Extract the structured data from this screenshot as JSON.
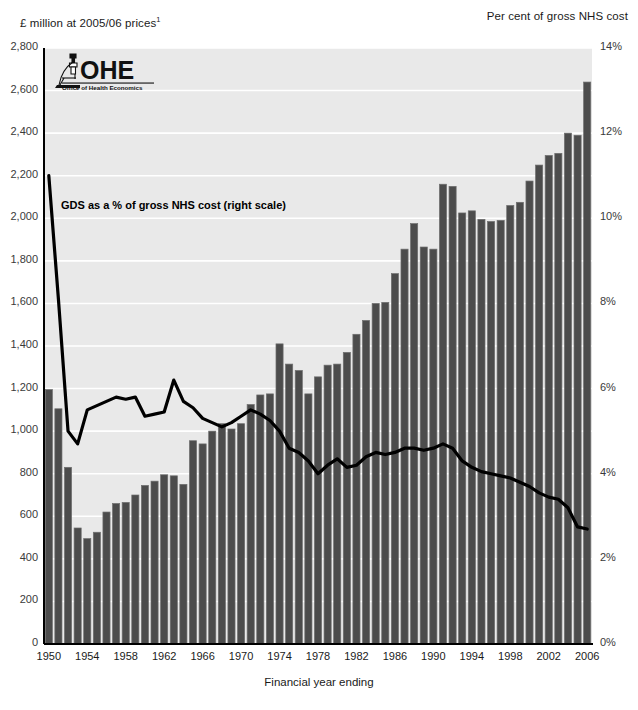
{
  "header": {
    "left_axis_title": "£ million at 2005/06 prices",
    "left_axis_title_sup": "1",
    "right_axis_title": "Per cent of gross NHS cost"
  },
  "logo": {
    "name": "OHE",
    "wordmark": "OHE",
    "subtitle": "Office of Health Economics"
  },
  "annotation": "GDS as a % of gross NHS cost (right scale)",
  "colors": {
    "plot_background": "#e9e9e9",
    "gridline": "#ffffff",
    "bar_fill": "#4c4c4c",
    "bar_edge": "#6e6e6e",
    "line": "#000000",
    "axis": "#000000",
    "tick_text": "#3a3a3a"
  },
  "chart_data": {
    "type": "bar",
    "title": "",
    "xlabel": "Financial year ending",
    "ylabel": "£ million at 2005/06 prices",
    "y2label": "Per cent of gross NHS cost",
    "grid": true,
    "legend": "none",
    "ylim": [
      0,
      2800
    ],
    "y2lim": [
      0,
      14
    ],
    "yticks": [
      0,
      200,
      400,
      600,
      800,
      1000,
      1200,
      1400,
      1600,
      1800,
      2000,
      2200,
      2400,
      2600,
      2800
    ],
    "ytick_labels": [
      "0",
      "200",
      "400",
      "600",
      "800",
      "1,000",
      "1,200",
      "1,400",
      "1,600",
      "1,800",
      "2,000",
      "2,200",
      "2,400",
      "2,600",
      "2,800"
    ],
    "y2ticks": [
      0,
      2,
      4,
      6,
      8,
      10,
      12,
      14
    ],
    "y2tick_labels": [
      "0%",
      "2%",
      "4%",
      "6%",
      "8%",
      "10%",
      "12%",
      "14%"
    ],
    "categories": [
      1950,
      1951,
      1952,
      1953,
      1954,
      1955,
      1956,
      1957,
      1958,
      1959,
      1960,
      1961,
      1962,
      1963,
      1964,
      1965,
      1966,
      1967,
      1968,
      1969,
      1970,
      1971,
      1972,
      1973,
      1974,
      1975,
      1976,
      1977,
      1978,
      1979,
      1980,
      1981,
      1982,
      1983,
      1984,
      1985,
      1986,
      1987,
      1988,
      1989,
      1990,
      1991,
      1992,
      1993,
      1994,
      1995,
      1996,
      1997,
      1998,
      1999,
      2000,
      2001,
      2002,
      2003,
      2004,
      2005,
      2006
    ],
    "xtick_labels": [
      "1950",
      "1954",
      "1958",
      "1962",
      "1966",
      "1970",
      "1974",
      "1978",
      "1982",
      "1986",
      "1990",
      "1994",
      "1998",
      "2002",
      "2006"
    ],
    "series": [
      {
        "name": "GDS expenditure",
        "type": "bar",
        "axis": "left",
        "unit": "£ million at 2005/06 prices",
        "values": [
          1195,
          1105,
          830,
          545,
          495,
          525,
          620,
          660,
          665,
          700,
          745,
          765,
          795,
          790,
          750,
          955,
          940,
          1000,
          1035,
          1010,
          1035,
          1125,
          1170,
          1175,
          1410,
          1315,
          1285,
          1175,
          1255,
          1310,
          1315,
          1370,
          1455,
          1520,
          1600,
          1605,
          1740,
          1855,
          1975,
          1865,
          1855,
          2160,
          2150,
          2025,
          2035,
          1995,
          1985,
          1990,
          2060,
          2075,
          2175,
          2250,
          2295,
          2305,
          2400,
          2390,
          2640
        ]
      },
      {
        "name": "GDS as a % of gross NHS cost",
        "type": "line",
        "axis": "right",
        "unit": "per cent",
        "values": [
          11.0,
          8.1,
          5.0,
          4.7,
          5.5,
          5.6,
          5.7,
          5.8,
          5.75,
          5.8,
          5.35,
          5.4,
          5.45,
          6.2,
          5.7,
          5.55,
          5.3,
          5.2,
          5.1,
          5.2,
          5.35,
          5.5,
          5.4,
          5.25,
          5.0,
          4.6,
          4.5,
          4.3,
          4.0,
          4.2,
          4.35,
          4.15,
          4.2,
          4.4,
          4.5,
          4.45,
          4.5,
          4.6,
          4.6,
          4.55,
          4.6,
          4.7,
          4.6,
          4.3,
          4.15,
          4.05,
          4.0,
          3.95,
          3.9,
          3.8,
          3.7,
          3.55,
          3.45,
          3.4,
          3.2,
          2.75,
          2.7
        ]
      }
    ]
  }
}
